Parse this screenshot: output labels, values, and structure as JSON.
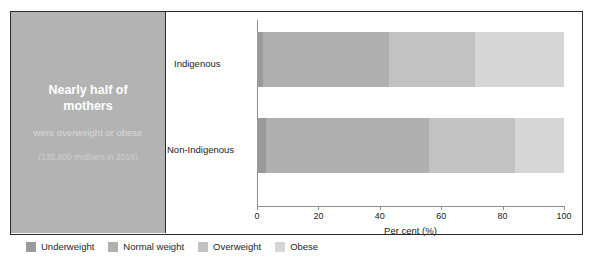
{
  "callout": {
    "headline": "Nearly half of mothers",
    "subline": "were overweight or obese",
    "note": "(135,809 mothers in 2018)",
    "background_color": "#b3b3b3",
    "headline_color": "#ffffff"
  },
  "chart_data": {
    "type": "bar",
    "orientation": "horizontal",
    "stacked": true,
    "title": "",
    "subtitle": "",
    "xlabel": "Per cent (%)",
    "ylabel": "",
    "xlim": [
      0,
      100
    ],
    "xticks": [
      0,
      20,
      40,
      60,
      80,
      100
    ],
    "xtick_labels": [
      "0",
      "20",
      "40",
      "60",
      "80",
      "100"
    ],
    "grid": false,
    "legend_position": "bottom-outside",
    "categories": [
      "Indigenous",
      "Non-Indigenous"
    ],
    "series": [
      {
        "name": "Underweight",
        "color": "#9a9a9a",
        "values": [
          2,
          3
        ]
      },
      {
        "name": "Normal weight",
        "color": "#b0b0b0",
        "values": [
          41,
          53
        ]
      },
      {
        "name": "Overweight",
        "color": "#c2c2c2",
        "values": [
          28,
          28
        ]
      },
      {
        "name": "Obese",
        "color": "#d6d6d6",
        "values": [
          29,
          16
        ]
      }
    ]
  },
  "legend": {
    "items": [
      {
        "label": "Underweight",
        "color": "#9a9a9a"
      },
      {
        "label": "Normal weight",
        "color": "#b0b0b0"
      },
      {
        "label": "Overweight",
        "color": "#c2c2c2"
      },
      {
        "label": "Obese",
        "color": "#d6d6d6"
      }
    ]
  }
}
